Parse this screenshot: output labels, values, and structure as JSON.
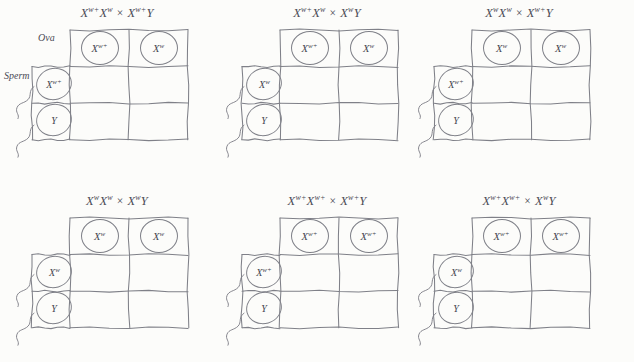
{
  "page": {
    "label_ova": "Ova",
    "label_sperm": "Sperm",
    "cross_symbol": "×",
    "ink_color": "#7f8088",
    "text_color": "#44444e",
    "background_color": "#fcfcfa"
  },
  "panels": [
    {
      "id": "panel-1",
      "title": {
        "p1_base": "X",
        "p1_sup": "w+",
        "p2_base": "X",
        "p2_sup": "w",
        "cross": "×",
        "p3_base": "X",
        "p3_sup": "w+",
        "p4_base": "Y",
        "p4_sup": ""
      },
      "ova": [
        {
          "base": "X",
          "sup": "w+"
        },
        {
          "base": "X",
          "sup": "w"
        }
      ],
      "sperm": [
        {
          "base": "X",
          "sup": "w+"
        },
        {
          "base": "Y",
          "sup": ""
        }
      ],
      "cells": [
        "",
        "",
        "",
        ""
      ],
      "show_axis_labels": true
    },
    {
      "id": "panel-2",
      "title": {
        "p1_base": "X",
        "p1_sup": "w+",
        "p2_base": "X",
        "p2_sup": "w",
        "cross": "×",
        "p3_base": "X",
        "p3_sup": "w",
        "p4_base": "Y",
        "p4_sup": ""
      },
      "ova": [
        {
          "base": "X",
          "sup": "w+"
        },
        {
          "base": "X",
          "sup": "w"
        }
      ],
      "sperm": [
        {
          "base": "X",
          "sup": "w"
        },
        {
          "base": "Y",
          "sup": ""
        }
      ],
      "cells": [
        "",
        "",
        "",
        ""
      ],
      "show_axis_labels": false
    },
    {
      "id": "panel-3",
      "title": {
        "p1_base": "X",
        "p1_sup": "w",
        "p2_base": "X",
        "p2_sup": "w",
        "cross": "×",
        "p3_base": "X",
        "p3_sup": "w+",
        "p4_base": "Y",
        "p4_sup": ""
      },
      "ova": [
        {
          "base": "X",
          "sup": "w"
        },
        {
          "base": "X",
          "sup": "w"
        }
      ],
      "sperm": [
        {
          "base": "X",
          "sup": "w+"
        },
        {
          "base": "Y",
          "sup": ""
        }
      ],
      "cells": [
        "",
        "",
        "",
        ""
      ],
      "show_axis_labels": false
    },
    {
      "id": "panel-4",
      "title": {
        "p1_base": "X",
        "p1_sup": "w",
        "p2_base": "X",
        "p2_sup": "w",
        "cross": "×",
        "p3_base": "X",
        "p3_sup": "w",
        "p4_base": "Y",
        "p4_sup": ""
      },
      "ova": [
        {
          "base": "X",
          "sup": "w"
        },
        {
          "base": "X",
          "sup": "w"
        }
      ],
      "sperm": [
        {
          "base": "X",
          "sup": "w"
        },
        {
          "base": "Y",
          "sup": ""
        }
      ],
      "cells": [
        "",
        "",
        "",
        ""
      ],
      "show_axis_labels": false
    },
    {
      "id": "panel-5",
      "title": {
        "p1_base": "X",
        "p1_sup": "w+",
        "p2_base": "X",
        "p2_sup": "w+",
        "cross": "×",
        "p3_base": "X",
        "p3_sup": "w+",
        "p4_base": "Y",
        "p4_sup": ""
      },
      "ova": [
        {
          "base": "X",
          "sup": "w+"
        },
        {
          "base": "X",
          "sup": "w+"
        }
      ],
      "sperm": [
        {
          "base": "X",
          "sup": "w+"
        },
        {
          "base": "Y",
          "sup": ""
        }
      ],
      "cells": [
        "",
        "",
        "",
        ""
      ],
      "show_axis_labels": false
    },
    {
      "id": "panel-6",
      "title": {
        "p1_base": "X",
        "p1_sup": "w+",
        "p2_base": "X",
        "p2_sup": "w+",
        "cross": "×",
        "p3_base": "X",
        "p3_sup": "w",
        "p4_base": "Y",
        "p4_sup": ""
      },
      "ova": [
        {
          "base": "X",
          "sup": "w+"
        },
        {
          "base": "X",
          "sup": "w+"
        }
      ],
      "sperm": [
        {
          "base": "X",
          "sup": "w"
        },
        {
          "base": "Y",
          "sup": ""
        }
      ],
      "cells": [
        "",
        "",
        "",
        ""
      ],
      "show_axis_labels": false
    }
  ]
}
